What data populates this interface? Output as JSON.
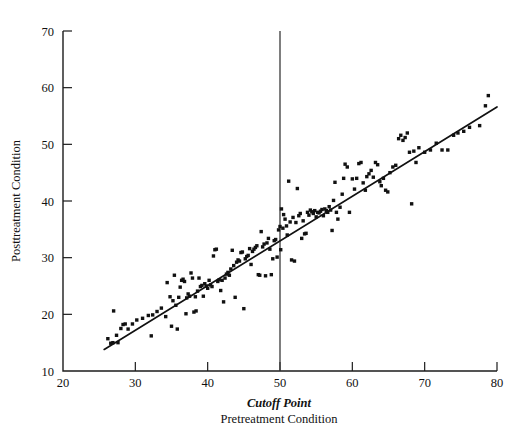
{
  "chart_data": {
    "type": "scatter",
    "title": "",
    "xlabel": "Pretreatment Condition",
    "xlabel_secondary": "Cutoff Point",
    "ylabel": "Posttreatment Condition",
    "xlim": [
      20,
      80
    ],
    "ylim": [
      10,
      70
    ],
    "xticks": [
      20,
      30,
      40,
      50,
      60,
      70,
      80
    ],
    "yticks": [
      10,
      20,
      30,
      40,
      50,
      60,
      70
    ],
    "xtick_labels": [
      "20",
      "30",
      "40",
      "50",
      "60",
      "70",
      "80"
    ],
    "ytick_labels": [
      "10",
      "20",
      "30",
      "40",
      "50",
      "60",
      "70"
    ],
    "grid": false,
    "legend": "none",
    "marker": "square",
    "marker_color": "#111111",
    "annotations": [
      {
        "name": "cutoff-line",
        "kind": "vertical-line",
        "x": 50,
        "label": "Cutoff Point",
        "color": "#3a3a3a"
      },
      {
        "name": "regression-line",
        "kind": "fit-line",
        "x_start": 25.7,
        "y_start": 13.8,
        "x_end": 80.0,
        "y_end": 56.6,
        "color": "#111111"
      }
    ],
    "points": [
      [
        26.2,
        15.7
      ],
      [
        26.6,
        14.9
      ],
      [
        26.9,
        15.0
      ],
      [
        27.0,
        20.6
      ],
      [
        27.4,
        16.3
      ],
      [
        27.6,
        15.0
      ],
      [
        28.0,
        17.5
      ],
      [
        28.3,
        18.2
      ],
      [
        28.6,
        18.3
      ],
      [
        29.0,
        17.4
      ],
      [
        29.6,
        18.3
      ],
      [
        30.2,
        19.0
      ],
      [
        31.0,
        19.3
      ],
      [
        31.8,
        19.8
      ],
      [
        32.2,
        16.2
      ],
      [
        32.4,
        19.9
      ],
      [
        33.0,
        20.5
      ],
      [
        33.6,
        21.1
      ],
      [
        34.2,
        19.6
      ],
      [
        34.4,
        25.6
      ],
      [
        34.8,
        23.1
      ],
      [
        35.0,
        17.9
      ],
      [
        35.2,
        22.4
      ],
      [
        35.4,
        26.9
      ],
      [
        35.6,
        21.6
      ],
      [
        35.8,
        17.4
      ],
      [
        36.0,
        23.0
      ],
      [
        36.2,
        24.8
      ],
      [
        36.4,
        26.0
      ],
      [
        36.6,
        26.2
      ],
      [
        36.8,
        25.8
      ],
      [
        37.0,
        20.1
      ],
      [
        37.1,
        22.9
      ],
      [
        37.3,
        23.6
      ],
      [
        37.5,
        23.2
      ],
      [
        37.7,
        27.3
      ],
      [
        37.9,
        26.4
      ],
      [
        38.1,
        20.4
      ],
      [
        38.3,
        23.1
      ],
      [
        38.4,
        20.6
      ],
      [
        38.6,
        24.1
      ],
      [
        38.8,
        26.4
      ],
      [
        39.0,
        24.9
      ],
      [
        39.2,
        25.1
      ],
      [
        39.4,
        23.2
      ],
      [
        39.6,
        25.4
      ],
      [
        39.8,
        25.0
      ],
      [
        40.0,
        24.6
      ],
      [
        40.2,
        26.0
      ],
      [
        40.4,
        25.2
      ],
      [
        40.6,
        24.9
      ],
      [
        40.8,
        30.3
      ],
      [
        41.0,
        31.4
      ],
      [
        41.2,
        31.5
      ],
      [
        41.4,
        25.8
      ],
      [
        41.6,
        26.1
      ],
      [
        41.8,
        24.2
      ],
      [
        42.0,
        26.0
      ],
      [
        42.2,
        22.2
      ],
      [
        42.4,
        26.4
      ],
      [
        42.6,
        27.1
      ],
      [
        42.8,
        27.4
      ],
      [
        43.0,
        26.9
      ],
      [
        43.2,
        28.0
      ],
      [
        43.4,
        31.3
      ],
      [
        43.6,
        28.6
      ],
      [
        43.8,
        23.0
      ],
      [
        44.0,
        29.2
      ],
      [
        44.2,
        29.6
      ],
      [
        44.4,
        29.4
      ],
      [
        44.6,
        30.9
      ],
      [
        44.8,
        31.0
      ],
      [
        45.0,
        21.0
      ],
      [
        45.2,
        29.8
      ],
      [
        45.4,
        30.2
      ],
      [
        45.6,
        30.4
      ],
      [
        45.8,
        31.6
      ],
      [
        46.0,
        28.8
      ],
      [
        46.2,
        31.1
      ],
      [
        46.4,
        31.5
      ],
      [
        46.6,
        31.8
      ],
      [
        46.8,
        32.1
      ],
      [
        47.0,
        27.0
      ],
      [
        47.2,
        26.9
      ],
      [
        47.4,
        34.6
      ],
      [
        47.6,
        31.9
      ],
      [
        47.8,
        32.4
      ],
      [
        48.0,
        26.8
      ],
      [
        48.2,
        32.6
      ],
      [
        48.4,
        33.4
      ],
      [
        48.6,
        31.5
      ],
      [
        48.8,
        27.0
      ],
      [
        49.0,
        29.8
      ],
      [
        49.2,
        33.0
      ],
      [
        49.4,
        33.2
      ],
      [
        49.6,
        30.1
      ],
      [
        49.8,
        34.9
      ],
      [
        50.0,
        35.5
      ],
      [
        50.1,
        31.4
      ],
      [
        50.2,
        38.6
      ],
      [
        50.4,
        35.2
      ],
      [
        50.5,
        37.6
      ],
      [
        50.7,
        36.8
      ],
      [
        50.9,
        35.6
      ],
      [
        51.0,
        34.0
      ],
      [
        51.2,
        43.5
      ],
      [
        51.4,
        36.3
      ],
      [
        51.6,
        29.6
      ],
      [
        51.8,
        37.1
      ],
      [
        52.0,
        29.4
      ],
      [
        52.2,
        36.2
      ],
      [
        52.4,
        42.2
      ],
      [
        52.6,
        37.4
      ],
      [
        52.8,
        37.8
      ],
      [
        53.0,
        33.4
      ],
      [
        53.2,
        36.5
      ],
      [
        53.4,
        34.2
      ],
      [
        53.6,
        34.3
      ],
      [
        53.8,
        38.0
      ],
      [
        54.0,
        37.5
      ],
      [
        54.2,
        38.4
      ],
      [
        54.4,
        38.1
      ],
      [
        54.6,
        37.8
      ],
      [
        54.8,
        38.3
      ],
      [
        55.0,
        37.2
      ],
      [
        55.2,
        38.0
      ],
      [
        55.4,
        37.9
      ],
      [
        55.6,
        38.2
      ],
      [
        55.8,
        38.5
      ],
      [
        56.0,
        37.4
      ],
      [
        56.2,
        38.6
      ],
      [
        56.4,
        38.3
      ],
      [
        56.6,
        38.0
      ],
      [
        56.8,
        39.0
      ],
      [
        57.0,
        38.4
      ],
      [
        57.2,
        34.8
      ],
      [
        57.4,
        40.1
      ],
      [
        57.6,
        43.3
      ],
      [
        57.8,
        38.0
      ],
      [
        58.0,
        36.8
      ],
      [
        58.3,
        38.9
      ],
      [
        58.6,
        41.2
      ],
      [
        58.8,
        44.0
      ],
      [
        59.0,
        46.5
      ],
      [
        59.3,
        46.0
      ],
      [
        59.6,
        38.0
      ],
      [
        60.0,
        43.9
      ],
      [
        60.3,
        42.1
      ],
      [
        60.6,
        44.0
      ],
      [
        60.9,
        46.6
      ],
      [
        61.2,
        46.8
      ],
      [
        61.5,
        43.2
      ],
      [
        61.8,
        41.9
      ],
      [
        62.0,
        44.3
      ],
      [
        62.3,
        44.8
      ],
      [
        62.6,
        45.4
      ],
      [
        62.9,
        44.2
      ],
      [
        63.2,
        46.8
      ],
      [
        63.5,
        46.4
      ],
      [
        63.8,
        43.4
      ],
      [
        64.0,
        42.7
      ],
      [
        64.3,
        44.0
      ],
      [
        64.6,
        41.9
      ],
      [
        64.9,
        41.6
      ],
      [
        65.2,
        45.0
      ],
      [
        65.6,
        46.0
      ],
      [
        66.0,
        46.3
      ],
      [
        66.4,
        51.0
      ],
      [
        66.7,
        51.6
      ],
      [
        67.0,
        50.7
      ],
      [
        67.3,
        51.2
      ],
      [
        67.6,
        52.0
      ],
      [
        67.9,
        48.6
      ],
      [
        68.2,
        39.5
      ],
      [
        68.5,
        48.8
      ],
      [
        68.8,
        46.8
      ],
      [
        69.2,
        49.4
      ],
      [
        70.0,
        48.6
      ],
      [
        70.8,
        49.0
      ],
      [
        71.6,
        50.2
      ],
      [
        72.4,
        49.0
      ],
      [
        73.2,
        49.0
      ],
      [
        74.0,
        51.6
      ],
      [
        74.6,
        52.0
      ],
      [
        75.4,
        52.3
      ],
      [
        76.2,
        53.0
      ],
      [
        77.6,
        53.3
      ],
      [
        78.4,
        56.8
      ],
      [
        78.8,
        58.6
      ]
    ]
  }
}
